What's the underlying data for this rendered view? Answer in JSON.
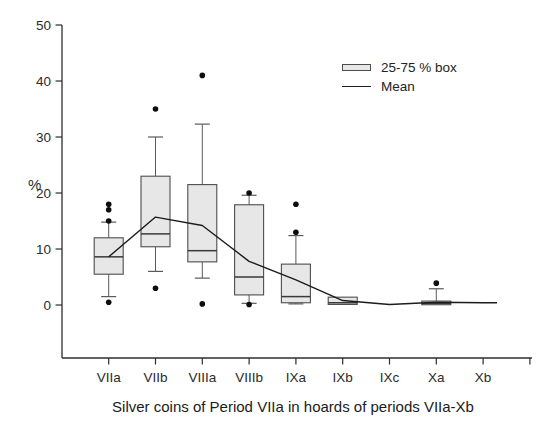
{
  "chart_data": {
    "type": "box",
    "title": "Silver coins of Period VIIa in hoards of periods VIIa-Xb",
    "ylabel": "%",
    "ylim": [
      0,
      50
    ],
    "yticks": [
      0,
      10,
      20,
      30,
      40,
      50
    ],
    "grid": false,
    "legend_position": "top-right",
    "categories": [
      "VIIa",
      "VIIb",
      "VIIIa",
      "VIIIb",
      "IXa",
      "IXb",
      "IXc",
      "Xa",
      "Xb"
    ],
    "boxes": [
      {
        "category": "VIIa",
        "q1": 5.5,
        "median": 8.6,
        "q3": 12.0,
        "whisker_low": 1.5,
        "whisker_high": 14.8,
        "outliers": [
          18,
          17,
          15,
          0.5
        ]
      },
      {
        "category": "VIIb",
        "q1": 10.4,
        "median": 12.7,
        "q3": 23.0,
        "whisker_low": 6.0,
        "whisker_high": 30.0,
        "outliers": [
          35,
          3
        ]
      },
      {
        "category": "VIIIa",
        "q1": 7.7,
        "median": 9.7,
        "q3": 21.5,
        "whisker_low": 4.8,
        "whisker_high": 32.3,
        "outliers": [
          41,
          0.2
        ]
      },
      {
        "category": "VIIIb",
        "q1": 1.8,
        "median": 5.0,
        "q3": 17.9,
        "whisker_low": 0.3,
        "whisker_high": 19.6,
        "outliers": [
          20,
          0.1
        ]
      },
      {
        "category": "IXa",
        "q1": 0.4,
        "median": 1.5,
        "q3": 7.3,
        "whisker_low": 0.2,
        "whisker_high": 12.4,
        "outliers": [
          18,
          13
        ]
      },
      {
        "category": "IXb",
        "q1": 0.1,
        "median": 0.4,
        "q3": 1.4,
        "whisker_low": null,
        "whisker_high": null,
        "outliers": []
      },
      {
        "category": "IXc",
        "q1": null,
        "median": null,
        "q3": null,
        "whisker_low": null,
        "whisker_high": null,
        "outliers": []
      },
      {
        "category": "Xa",
        "q1": 0.05,
        "median": 0.3,
        "q3": 0.7,
        "whisker_low": null,
        "whisker_high": 2.9,
        "outliers": [
          3.9
        ]
      },
      {
        "category": "Xb",
        "q1": null,
        "median": null,
        "q3": null,
        "whisker_low": null,
        "whisker_high": null,
        "outliers": []
      }
    ],
    "series": [
      {
        "name": "Mean",
        "values": [
          8.6,
          15.7,
          14.2,
          7.8,
          4.5,
          0.8,
          0.1,
          0.5,
          0.4
        ]
      }
    ],
    "legend": [
      {
        "swatch": "box",
        "label": "25-75 % box"
      },
      {
        "swatch": "line",
        "label": "Mean"
      }
    ],
    "style": {
      "background": "#ffffff",
      "box_fill": "#e7e7e7",
      "box_stroke": "#4d4d4d",
      "median_color": "#3a3a3a",
      "whisker_color": "#5a5a5a",
      "mean_line_color": "#1c1c1c",
      "outlier_color": "#0d0d0d",
      "axis_color": "#2e2e2e",
      "text_color": "#2b2b2b"
    }
  }
}
